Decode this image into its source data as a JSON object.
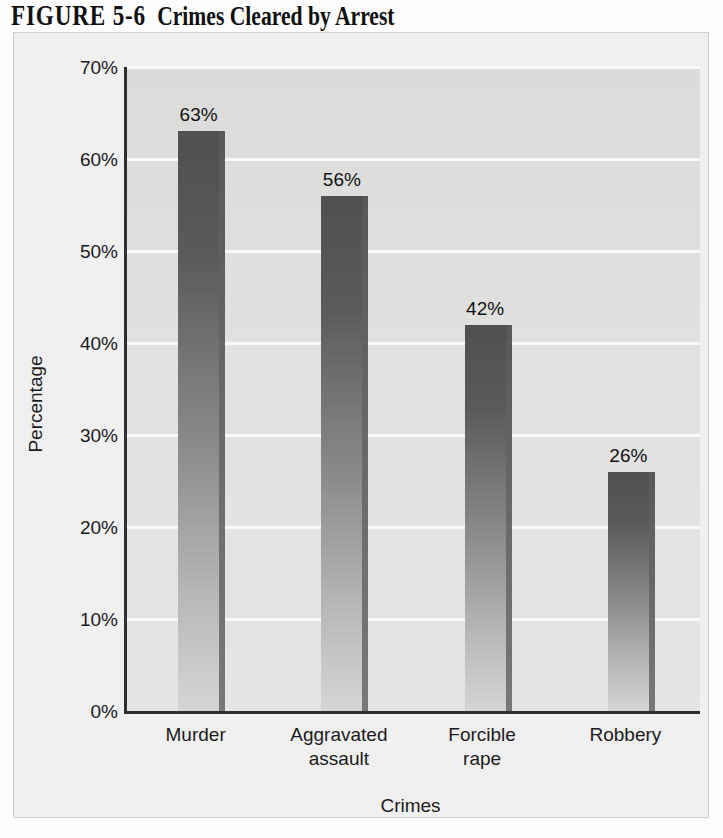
{
  "title": {
    "figure_number": "FIGURE 5-6",
    "caption": "Crimes Cleared by Arrest"
  },
  "chart_data": {
    "type": "bar",
    "xlabel": "Crimes",
    "ylabel": "Percentage",
    "categories": [
      "Murder",
      "Aggravated assault",
      "Forcible rape",
      "Robbery"
    ],
    "category_labels_multiline": [
      "Murder",
      "Aggravated\nassault",
      "Forcible\nrape",
      "Robbery"
    ],
    "values": [
      63,
      56,
      42,
      26
    ],
    "value_labels": [
      "63%",
      "56%",
      "42%",
      "26%"
    ],
    "ylim": [
      0,
      70
    ],
    "ytick_values": [
      0,
      10,
      20,
      30,
      40,
      50,
      60,
      70
    ],
    "ytick_labels": [
      "0%",
      "10%",
      "20%",
      "30%",
      "40%",
      "50%",
      "60%",
      "70%"
    ],
    "grid": true,
    "gridline_color": "#fbfbfb",
    "legend": null,
    "bar_color_top": "#4f4f4f",
    "bar_color_bottom": "#d6d6d4",
    "plot_background": "#e0e0de",
    "panel_background": "#f1f1f1",
    "axis_color": "#2f2f2f"
  }
}
